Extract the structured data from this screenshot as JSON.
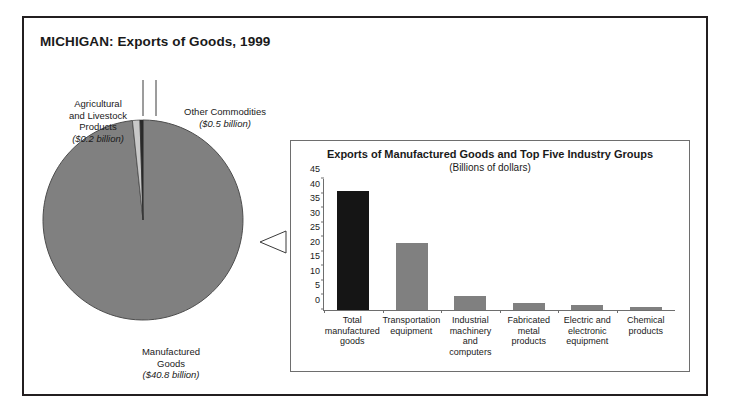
{
  "figure": {
    "title": "MICHIGAN: Exports of Goods, 1999"
  },
  "pie": {
    "labels": {
      "agricultural": {
        "name": "Agricultural\nand Livestock\nProducts",
        "amount": "($0.2 billion)"
      },
      "other": {
        "name": "Other Commodities",
        "amount": "($0.5 billion)"
      },
      "manufactured": {
        "name": "Manufactured\nGoods",
        "amount": "($40.8 billion)"
      }
    }
  },
  "bar_panel": {
    "title": "Exports of Manufactured Goods and Top Five Industry Groups",
    "subtitle": "(Billions of dollars)"
  },
  "colors": {
    "highlight_bar": "#151515",
    "bar": "#808080",
    "pie_slice": "#808080",
    "pie_thin_slice": "#c8c8c8",
    "outline": "#231f20",
    "panel_border": "#6e6e6e",
    "background": "#ffffff"
  },
  "chart_data": [
    {
      "type": "pie",
      "title": "MICHIGAN: Exports of Goods, 1999",
      "unit": "billions of dollars",
      "categories": [
        "Manufactured Goods",
        "Other Commodities",
        "Agricultural and Livestock Products"
      ],
      "values": [
        40.8,
        0.5,
        0.2
      ],
      "labels": [
        "($40.8 billion)",
        "($0.5 billion)",
        "($0.2 billion)"
      ],
      "colors": [
        "#808080",
        "#c8c8c8",
        "#1a1a1a"
      ],
      "legend": "none",
      "start_angle_deg": -90,
      "direction": "clockwise"
    },
    {
      "type": "bar",
      "title": "Exports of Manufactured Goods and Top Five Industry Groups",
      "subtitle": "(Billions of dollars)",
      "xlabel": "",
      "ylabel": "",
      "ylim": [
        0,
        45
      ],
      "yticks": [
        0,
        5,
        10,
        15,
        20,
        25,
        30,
        35,
        40,
        45
      ],
      "grid": false,
      "categories": [
        "Total manufactured goods",
        "Transportation equipment",
        "Industrial machinery and computers",
        "Fabricated metal products",
        "Electric and electronic equipment",
        "Chemical products"
      ],
      "category_label_lines": [
        [
          "Total",
          "manufactured",
          "goods"
        ],
        [
          "Transportation",
          "equipment"
        ],
        [
          "Industrial",
          "machinery and",
          "computers"
        ],
        [
          "Fabricated",
          "metal products"
        ],
        [
          "Electric and",
          "electronic",
          "equipment"
        ],
        [
          "Chemical",
          "products"
        ]
      ],
      "values": [
        40.8,
        23.0,
        4.7,
        2.3,
        1.6,
        1.2
      ],
      "bar_colors": [
        "#151515",
        "#808080",
        "#808080",
        "#808080",
        "#808080",
        "#808080"
      ]
    }
  ]
}
